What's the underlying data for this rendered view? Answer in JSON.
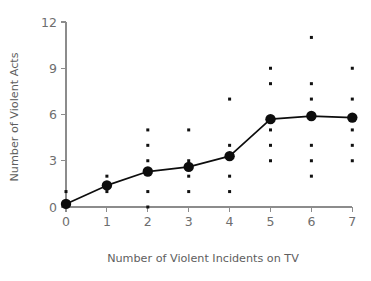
{
  "chart_data": {
    "type": "scatter",
    "title": "",
    "subtitle": "",
    "xlabel": "Number of Violent Incidents on TV",
    "ylabel": "Number of Violent Acts",
    "xlim": [
      0,
      7
    ],
    "ylim": [
      0,
      12
    ],
    "xticks": [
      "0",
      "1",
      "2",
      "3",
      "4",
      "5",
      "6",
      "7"
    ],
    "yticks": [
      "0",
      "3",
      "6",
      "9",
      "12"
    ],
    "grid": false,
    "legend": false,
    "legend_position": "none",
    "x": [
      0,
      1,
      2,
      3,
      4,
      5,
      6,
      7
    ],
    "series": [
      {
        "name": "Mean number of violent acts",
        "marker": "large-filled-circle",
        "connected": true,
        "color": "#0d0d0d",
        "values": [
          0.2,
          1.4,
          2.3,
          2.6,
          3.3,
          5.7,
          5.9,
          5.8
        ]
      },
      {
        "name": "Individual observations",
        "marker": "small-filled-square",
        "connected": false,
        "color": "#111111",
        "points_by_x": [
          {
            "x": 0,
            "y": [
              1
            ]
          },
          {
            "x": 1,
            "y": [
              1,
              2
            ]
          },
          {
            "x": 2,
            "y": [
              0,
              1,
              3,
              4,
              5
            ]
          },
          {
            "x": 3,
            "y": [
              1,
              2,
              3,
              5
            ]
          },
          {
            "x": 4,
            "y": [
              1,
              2,
              4,
              7
            ]
          },
          {
            "x": 5,
            "y": [
              3,
              4,
              5,
              8,
              9
            ]
          },
          {
            "x": 6,
            "y": [
              2,
              3,
              4,
              7,
              8,
              11
            ]
          },
          {
            "x": 7,
            "y": [
              3,
              4,
              5,
              7,
              9
            ]
          }
        ]
      }
    ]
  },
  "colors": {
    "axis": "#8c8c8c",
    "tick_label": "#6e6e6e",
    "axis_title": "#5e5e5e",
    "data": "#0d0d0d",
    "background": "#ffffff"
  }
}
